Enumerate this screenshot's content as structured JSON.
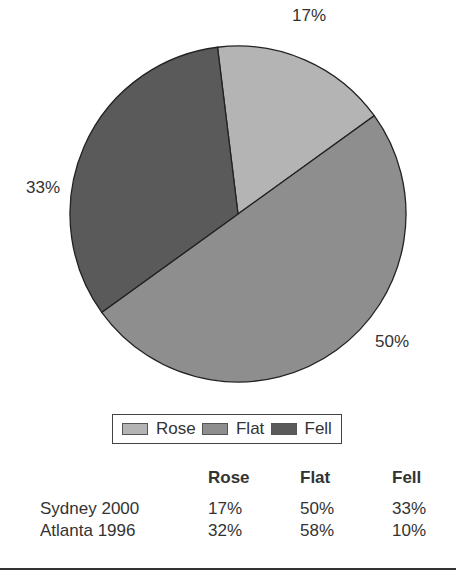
{
  "chart_data": {
    "type": "pie",
    "title": "",
    "categories": [
      "Rose",
      "Flat",
      "Fell"
    ],
    "values": [
      17,
      50,
      33
    ],
    "labels": [
      "17%",
      "50%",
      "33%"
    ],
    "colors": [
      "#b4b4b4",
      "#8e8e8e",
      "#5a5a5a"
    ],
    "legend_position": "bottom",
    "table": {
      "columns": [
        "",
        "Rose",
        "Flat",
        "Fell"
      ],
      "rows": [
        {
          "label": "Sydney 2000",
          "values": [
            "17%",
            "50%",
            "33%"
          ]
        },
        {
          "label": "Atlanta 1996",
          "values": [
            "32%",
            "58%",
            "10%"
          ]
        }
      ]
    }
  },
  "pie_labels": {
    "rose": "17%",
    "flat": "50%",
    "fell": "33%"
  },
  "legend": {
    "rose": "Rose",
    "flat": "Flat",
    "fell": "Fell"
  },
  "table": {
    "headers": {
      "rose": "Rose",
      "flat": "Flat",
      "fell": "Fell"
    },
    "rows": [
      {
        "label": "Sydney 2000",
        "rose": "17%",
        "flat": "50%",
        "fell": "33%"
      },
      {
        "label": "Atlanta 1996",
        "rose": "32%",
        "flat": "58%",
        "fell": "10%"
      }
    ]
  }
}
